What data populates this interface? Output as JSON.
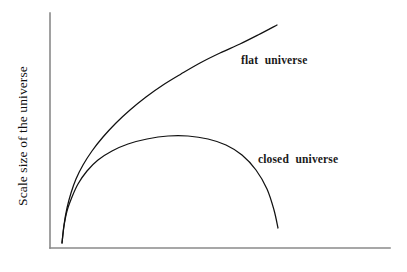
{
  "figure": {
    "ylabel": "Scale size of the universe",
    "xlabel": "",
    "title": ""
  },
  "labels": {
    "flat": "flat  universe",
    "closed": "closed  universe"
  },
  "colors": {
    "curve": "#111111",
    "axis": "#8a8a8a",
    "background": "#ffffff",
    "text": "#111111"
  },
  "chart_data": {
    "type": "line",
    "title": "",
    "xlabel": "",
    "ylabel": "Scale size of the universe",
    "grid": false,
    "legend": "inline-annotations",
    "xlim": [
      0,
      1
    ],
    "ylim": [
      0,
      1
    ],
    "axis_ticks": {
      "x": [],
      "y": []
    },
    "series": [
      {
        "name": "flat  universe",
        "annotation": "flat  universe",
        "annotation_xy": [
          0.56,
          0.82
        ],
        "points_px": [
          [
            62,
            243
          ],
          [
            64,
            225
          ],
          [
            67,
            208
          ],
          [
            71,
            193
          ],
          [
            76,
            179
          ],
          [
            83,
            165
          ],
          [
            92,
            151
          ],
          [
            103,
            137
          ],
          [
            116,
            123
          ],
          [
            130,
            110
          ],
          [
            146,
            97
          ],
          [
            163,
            85
          ],
          [
            181,
            74
          ],
          [
            200,
            63
          ],
          [
            220,
            53
          ],
          [
            240,
            44
          ],
          [
            258,
            35
          ],
          [
            277,
            25
          ]
        ],
        "x": [
          0.035,
          0.041,
          0.05,
          0.062,
          0.076,
          0.097,
          0.124,
          0.156,
          0.194,
          0.235,
          0.282,
          0.332,
          0.385,
          0.441,
          0.5,
          0.559,
          0.612,
          0.668
        ],
        "y": [
          0.021,
          0.098,
          0.17,
          0.234,
          0.294,
          0.353,
          0.413,
          0.472,
          0.532,
          0.587,
          0.643,
          0.694,
          0.74,
          0.787,
          0.83,
          0.868,
          0.906,
          0.949
        ]
      },
      {
        "name": "closed  universe",
        "annotation": "closed  universe",
        "annotation_xy": [
          0.61,
          0.37
        ],
        "points_px": [
          [
            62,
            243
          ],
          [
            64,
            226
          ],
          [
            67,
            211
          ],
          [
            72,
            197
          ],
          [
            78,
            184
          ],
          [
            87,
            171
          ],
          [
            98,
            160
          ],
          [
            112,
            151
          ],
          [
            128,
            144
          ],
          [
            147,
            139
          ],
          [
            168,
            136
          ],
          [
            188,
            136
          ],
          [
            208,
            139
          ],
          [
            226,
            145
          ],
          [
            242,
            155
          ],
          [
            256,
            170
          ],
          [
            267,
            189
          ],
          [
            274,
            210
          ],
          [
            278,
            228
          ]
        ],
        "x": [
          0.035,
          0.041,
          0.05,
          0.065,
          0.082,
          0.109,
          0.141,
          0.182,
          0.229,
          0.285,
          0.347,
          0.406,
          0.465,
          0.518,
          0.565,
          0.606,
          0.638,
          0.659,
          0.671
        ],
        "y": [
          0.021,
          0.093,
          0.157,
          0.217,
          0.272,
          0.328,
          0.374,
          0.413,
          0.442,
          0.464,
          0.476,
          0.476,
          0.464,
          0.438,
          0.396,
          0.332,
          0.251,
          0.162,
          0.085
        ]
      }
    ]
  }
}
